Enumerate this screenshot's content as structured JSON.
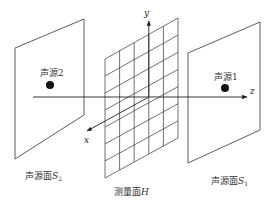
{
  "diagram": {
    "title": "",
    "planes": {
      "source_plane_2": {
        "label": "声源面",
        "symbol": "S",
        "subscript": "2"
      },
      "measurement_plane": {
        "label": "测量面",
        "symbol": "H"
      },
      "source_plane_1": {
        "label": "声源面",
        "symbol": "S",
        "subscript": "1"
      }
    },
    "sources": {
      "source_2": {
        "label": "声源2"
      },
      "source_1": {
        "label": "声源1"
      }
    },
    "axes": {
      "x": "x",
      "y": "y",
      "z": "z"
    },
    "grid": {
      "columns": 5,
      "rows": 7
    },
    "colors": {
      "line": "#333333",
      "dot": "#111111"
    }
  }
}
